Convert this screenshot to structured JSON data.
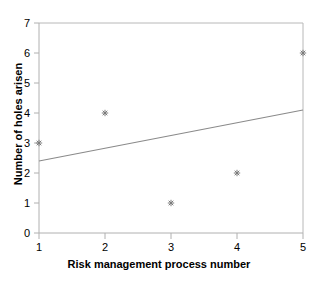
{
  "chart_data": {
    "type": "scatter",
    "title": "",
    "xlabel": "Risk management process number",
    "ylabel": "Number of holes arisen",
    "x": [
      1,
      2,
      3,
      4,
      5
    ],
    "y": [
      3,
      4,
      1,
      2,
      6
    ],
    "points": [
      {
        "x": 1,
        "y": 3
      },
      {
        "x": 2,
        "y": 4
      },
      {
        "x": 3,
        "y": 1
      },
      {
        "x": 4,
        "y": 2
      },
      {
        "x": 5,
        "y": 6
      }
    ],
    "xlim": [
      1,
      5
    ],
    "ylim": [
      0,
      7
    ],
    "xticks": [
      1,
      2,
      3,
      4,
      5
    ],
    "yticks": [
      0,
      1,
      2,
      3,
      4,
      5,
      6,
      7
    ],
    "xtick_labels": [
      "1",
      "2",
      "3",
      "4",
      "5"
    ],
    "ytick_labels": [
      "0",
      "1",
      "2",
      "3",
      "4",
      "5",
      "6",
      "7"
    ],
    "grid": false,
    "legend": null,
    "series": [
      {
        "name": "observations",
        "type": "scatter",
        "marker": "asterisk",
        "color": "#808080",
        "values": [
          3,
          4,
          1,
          2,
          6
        ]
      },
      {
        "name": "trendline",
        "type": "line",
        "color": "#888888",
        "x_start": 1,
        "y_start": 2.4,
        "x_end": 5,
        "y_end": 4.1
      }
    ],
    "annotations": []
  },
  "axes": {
    "x_title": "Risk management process number",
    "y_title": "Number of holes arisen",
    "x_tick_labels": [
      "1",
      "2",
      "3",
      "4",
      "5"
    ],
    "y_tick_labels": [
      "0",
      "1",
      "2",
      "3",
      "4",
      "5",
      "6",
      "7"
    ]
  },
  "colors": {
    "background": "#ffffff",
    "axis": "#aaaaaa",
    "marker": "#808080",
    "trendline": "#888888",
    "text": "#000000"
  }
}
